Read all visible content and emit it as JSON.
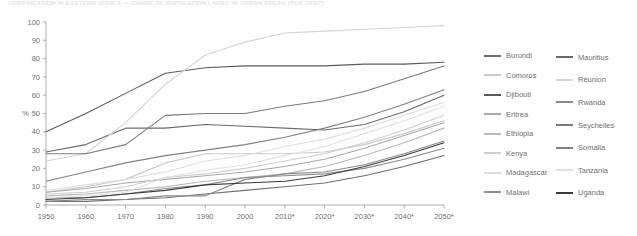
{
  "title": "URBANIZATION IN EASTERN AFRICA — SHARE OF POPULATION LIVING IN URBAN AREAS (PER CENT)",
  "axis": {
    "y_label": "%",
    "y_ticks": [
      "0",
      "10",
      "20",
      "30",
      "40",
      "50",
      "60",
      "70",
      "80",
      "90",
      "100"
    ],
    "x_ticks": [
      "1950",
      "1960",
      "1970",
      "1980",
      "1990",
      "2000",
      "2010*",
      "2020*",
      "2030*",
      "2040*",
      "2050*"
    ]
  },
  "legend": {
    "column1": [
      {
        "label": "Burundi",
        "color": "#6e6e70"
      },
      {
        "label": "Comoros",
        "color": "#c9c9cb"
      },
      {
        "label": "Djibouti",
        "color": "#5b5b5d"
      },
      {
        "label": "Eritrea",
        "color": "#a9a9ab"
      },
      {
        "label": "Ethiopia",
        "color": "#b8b8ba"
      },
      {
        "label": "Kenya",
        "color": "#cfcfd1"
      },
      {
        "label": "Madagascar",
        "color": "#dedee0"
      },
      {
        "label": "Malawi",
        "color": "#8c8c8e"
      }
    ],
    "column2": [
      {
        "label": "Mauritius",
        "color": "#6a6a6c"
      },
      {
        "label": "Réunion",
        "color": "#d4d4d6"
      },
      {
        "label": "Rwanda",
        "color": "#8a8a8c"
      },
      {
        "label": "Seychelles",
        "color": "#7a7a7c"
      },
      {
        "label": "Somalia",
        "color": "#818183"
      },
      {
        "label": "Tanzania",
        "color": "#e0e0e2"
      },
      {
        "label": "Uganda",
        "color": "#3a3a3c"
      }
    ]
  },
  "chart_data": {
    "type": "line",
    "title": "URBANIZATION IN EASTERN AFRICA — SHARE OF POPULATION LIVING IN URBAN AREAS (PER CENT)",
    "xlabel": "",
    "ylabel": "%",
    "xlim": [
      1950,
      2050
    ],
    "ylim": [
      0,
      100
    ],
    "grid": false,
    "legend_position": "right",
    "x": [
      1950,
      1960,
      1970,
      1980,
      1990,
      2000,
      2010,
      2020,
      2030,
      2040,
      2050
    ],
    "x_tick_labels": [
      "1950",
      "1960",
      "1970",
      "1980",
      "1990",
      "2000",
      "2010*",
      "2020*",
      "2030*",
      "2040*",
      "2050*"
    ],
    "note": "Values after 2010 are projections (marked with *)",
    "series": [
      {
        "name": "Burundi",
        "color": "#6e6e70",
        "values": [
          2,
          2,
          3,
          4,
          6,
          8,
          10,
          12,
          16,
          21,
          27
        ]
      },
      {
        "name": "Comoros",
        "color": "#c9c9cb",
        "values": [
          7,
          10,
          14,
          23,
          28,
          28,
          28,
          29,
          33,
          39,
          46
        ]
      },
      {
        "name": "Djibouti",
        "color": "#5b5b5d",
        "values": [
          40,
          50,
          61,
          72,
          75,
          76,
          76,
          76,
          77,
          77,
          78
        ]
      },
      {
        "name": "Eritrea",
        "color": "#a9a9ab",
        "values": [
          7,
          9,
          12,
          14,
          16,
          18,
          21,
          25,
          31,
          38,
          45
        ]
      },
      {
        "name": "Ethiopia",
        "color": "#b8b8ba",
        "values": [
          5,
          6,
          8,
          10,
          13,
          15,
          17,
          21,
          27,
          34,
          42
        ]
      },
      {
        "name": "Kenya",
        "color": "#cfcfd1",
        "values": [
          6,
          7,
          10,
          15,
          17,
          20,
          24,
          28,
          34,
          41,
          49
        ]
      },
      {
        "name": "Madagascar",
        "color": "#dedee0",
        "values": [
          8,
          11,
          14,
          18,
          24,
          27,
          32,
          36,
          42,
          49,
          56
        ]
      },
      {
        "name": "Malawi",
        "color": "#8c8c8e",
        "values": [
          4,
          4,
          6,
          9,
          11,
          15,
          16,
          17,
          20,
          25,
          31
        ]
      },
      {
        "name": "Mauritius",
        "color": "#6a6a6c",
        "values": [
          29,
          33,
          42,
          42,
          44,
          43,
          42,
          41,
          44,
          51,
          60
        ]
      },
      {
        "name": "Réunion",
        "color": "#d4d4d6",
        "values": [
          24,
          28,
          45,
          66,
          82,
          89,
          94,
          95,
          96,
          97,
          98
        ]
      },
      {
        "name": "Rwanda",
        "color": "#8a8a8c",
        "values": [
          2,
          3,
          3,
          5,
          5,
          14,
          17,
          18,
          22,
          28,
          35
        ]
      },
      {
        "name": "Seychelles",
        "color": "#7a7a7c",
        "values": [
          28,
          28,
          33,
          49,
          50,
          50,
          54,
          57,
          62,
          69,
          76
        ]
      },
      {
        "name": "Somalia",
        "color": "#818183",
        "values": [
          13,
          18,
          23,
          27,
          30,
          33,
          37,
          42,
          48,
          55,
          63
        ]
      },
      {
        "name": "Tanzania",
        "color": "#e0e0e2",
        "values": [
          4,
          5,
          7,
          15,
          19,
          22,
          27,
          32,
          39,
          46,
          54
        ]
      },
      {
        "name": "Uganda",
        "color": "#3a3a3c",
        "values": [
          3,
          4,
          6,
          8,
          11,
          12,
          13,
          16,
          21,
          27,
          34
        ]
      }
    ]
  }
}
